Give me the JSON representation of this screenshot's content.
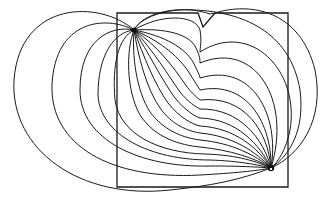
{
  "figure": {
    "type": "field-line diagram",
    "colors": {
      "stroke": "#1a1a1a",
      "background": "#ffffff"
    },
    "frame": {
      "x": 117,
      "y": 13,
      "width": 171,
      "height": 174
    },
    "source_point": {
      "x": 134,
      "y": 30
    },
    "sink_point": {
      "x": 271,
      "y": 168
    },
    "notch": {
      "points": [
        [
          198,
          13
        ],
        [
          203,
          27
        ],
        [
          215,
          13
        ]
      ]
    },
    "line_count": 19
  }
}
